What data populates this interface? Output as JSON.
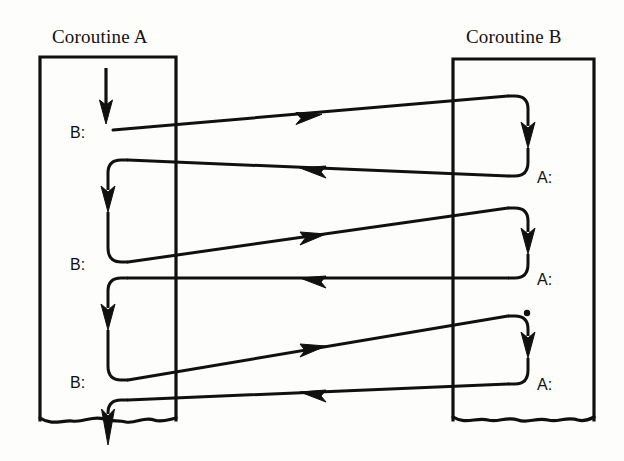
{
  "diagram": {
    "title_a": "Coroutine A",
    "title_b": "Coroutine B",
    "type": "coroutine-control-flow",
    "columns": [
      {
        "id": "a",
        "header": "Coroutine A",
        "box": {
          "x": 40,
          "y": 57,
          "width": 136,
          "height": 363,
          "bottom_edge": "torn"
        },
        "resume_labels": [
          "B:",
          "B:",
          "B:"
        ],
        "label_positions_y": [
          133,
          265,
          383
        ]
      },
      {
        "id": "b",
        "header": "Coroutine B",
        "box": {
          "x": 453,
          "y": 59,
          "width": 141,
          "height": 361,
          "bottom_edge": "torn"
        },
        "resume_labels": [
          "A:",
          "A:",
          "A:"
        ],
        "label_positions_y": [
          178,
          280,
          385
        ],
        "ellipsis_dot": true
      }
    ],
    "transfers": [
      {
        "from": "a",
        "to": "b",
        "direction": "right",
        "label": "B:"
      },
      {
        "from": "b",
        "to": "a",
        "direction": "left",
        "label": "A:"
      },
      {
        "from": "a",
        "to": "b",
        "direction": "right",
        "label": "B:"
      },
      {
        "from": "b",
        "to": "a",
        "direction": "left",
        "label": "A:"
      },
      {
        "from": "a",
        "to": "b",
        "direction": "right",
        "label": "B:"
      },
      {
        "from": "b",
        "to": "a",
        "direction": "left",
        "label": "A:"
      }
    ],
    "entry_arrow": {
      "column": "a",
      "direction": "down",
      "at_top": true
    },
    "exit_arrow": {
      "column": "a",
      "direction": "down",
      "at_bottom": true
    },
    "colors": {
      "ink": "#101010",
      "paper": "#fdfdfc"
    }
  }
}
